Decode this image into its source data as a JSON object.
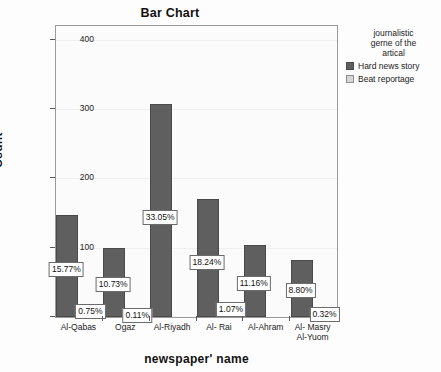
{
  "chart_data": {
    "type": "bar",
    "title": "Bar Chart",
    "xlabel": "newspaper' name",
    "ylabel": "Count",
    "ylim": [
      0,
      420
    ],
    "yticks": [
      0,
      100,
      200,
      300,
      400
    ],
    "ytick_labels": [
      "0",
      "100",
      "200",
      "300",
      "400"
    ],
    "grid": true,
    "legend_position": "right",
    "legend_title": "journalistic\ngerne of the\nartical",
    "categories": [
      "Al-Qabas",
      "Ogaz",
      "Al-Riyadh",
      "Al- Rai",
      "Al-Ahram",
      "Al- Masry\nAl-Yuom"
    ],
    "series": [
      {
        "name": "Hard news story",
        "color": "#5f5f5f",
        "values": [
          147,
          100,
          308,
          170,
          104,
          82
        ],
        "labels": [
          "15.77%",
          "10.73%",
          "33.05%",
          "18.24%",
          "11.16%",
          "8.80%"
        ]
      },
      {
        "name": "Beat reportage",
        "color": "#d6d6d6",
        "values": [
          7,
          1,
          0,
          10,
          0,
          3
        ],
        "labels": [
          "0.75%",
          "0.11%",
          "",
          "1.07%",
          "",
          "0.32%"
        ]
      }
    ]
  }
}
